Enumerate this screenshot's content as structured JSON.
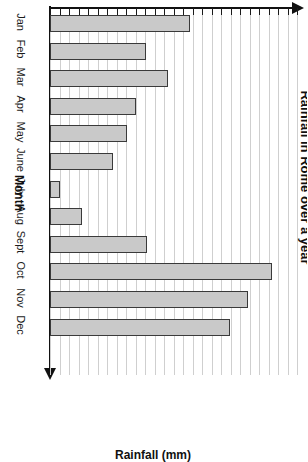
{
  "chart_data": {
    "type": "bar",
    "title": "Rainfall in Rome over a year",
    "xlabel": "Month",
    "ylabel": "Rainfall (mm)",
    "orientation": "horizontal-rotated",
    "grid": true,
    "legend": "none",
    "xlim": [
      0,
      26
    ],
    "categories": [
      "Jan",
      "Feb",
      "Mar",
      "Apr",
      "May",
      "June",
      "July",
      "Aug",
      "Sept",
      "Oct",
      "Nov",
      "Dec"
    ],
    "values": [
      14.7,
      10.1,
      12.4,
      9.1,
      8.1,
      6.6,
      1.1,
      3.4,
      10.2,
      23.4,
      20.8,
      19.0
    ],
    "bar_pixel_lengths": [
      140,
      96,
      118,
      86,
      77,
      63,
      10,
      32,
      97,
      222,
      198,
      180
    ],
    "gridline_count": 26,
    "gridline_spacing_px": 9.5
  },
  "labels": {
    "month_axis": "Month",
    "value_axis": "Rainfall (mm)",
    "title": "Rainfall in Rome over a year"
  },
  "colors": {
    "bar_fill": "#c9c9c9",
    "bar_border": "#3a3a3a",
    "axis": "#111111",
    "gridline": "#cfcfcf",
    "background": "#ffffff"
  }
}
